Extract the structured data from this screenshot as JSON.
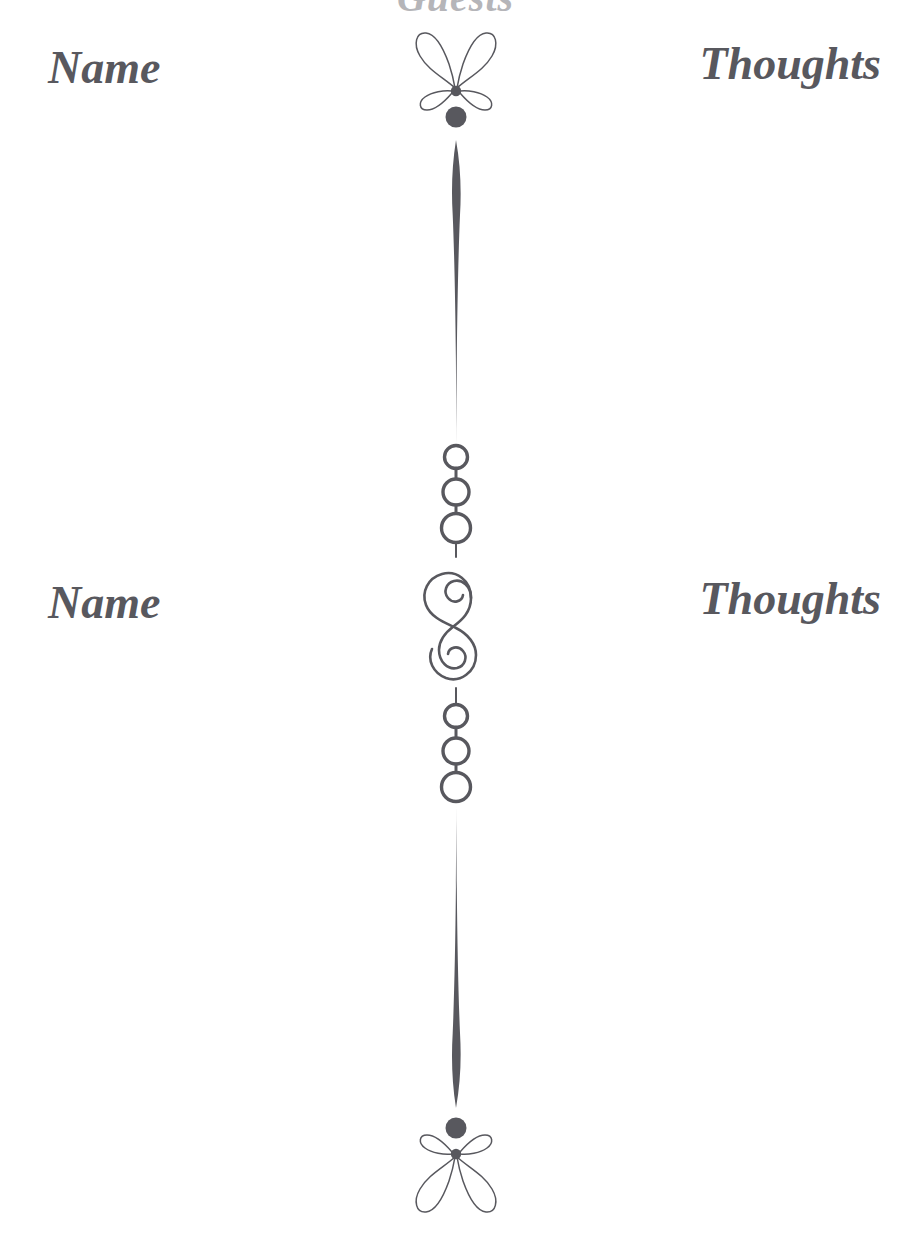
{
  "page": {
    "title": "Guests",
    "background_color": "#ffffff",
    "ink_color": "#58585e",
    "width": 911,
    "height": 1245
  },
  "entries": [
    {
      "name_label": "Name",
      "thoughts_label": "Thoughts",
      "name_value": "",
      "thoughts_value": "",
      "name_placeholder": "",
      "thoughts_placeholder": ""
    },
    {
      "name_label": "Name",
      "thoughts_label": "Thoughts",
      "name_value": "",
      "thoughts_value": "",
      "name_placeholder": "",
      "thoughts_placeholder": ""
    }
  ],
  "divider": {
    "ornaments": [
      {
        "name": "fleuron-top",
        "type": "four-petal-fleuron",
        "orientation": "up"
      },
      {
        "name": "stem-upper",
        "type": "tapered-stem"
      },
      {
        "name": "circle-trio-upper",
        "type": "three-circles",
        "count": 3
      },
      {
        "name": "scroll-s",
        "type": "s-scroll"
      },
      {
        "name": "circle-trio-lower",
        "type": "three-circles",
        "count": 3
      },
      {
        "name": "stem-lower",
        "type": "tapered-stem"
      },
      {
        "name": "fleuron-bottom",
        "type": "four-petal-fleuron",
        "orientation": "down"
      }
    ]
  }
}
